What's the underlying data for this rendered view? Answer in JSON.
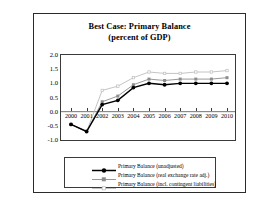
{
  "figure": {
    "title_line1": "Best Case: Primary Balance",
    "title_line2": "(percent of GDP)"
  },
  "chart_data": {
    "type": "line",
    "title": "Best Case: Primary Balance (percent of GDP)",
    "xlabel": "",
    "ylabel": "",
    "categories": [
      "2000",
      "2001",
      "2002",
      "2003",
      "2004",
      "2005",
      "2006",
      "2007",
      "2008",
      "2009",
      "2010"
    ],
    "x": [
      2000,
      2001,
      2002,
      2003,
      2004,
      2005,
      2006,
      2007,
      2008,
      2009,
      2010
    ],
    "ylim": [
      -1.0,
      2.0
    ],
    "yticks": [
      "2.0",
      "1.5",
      "1.0",
      "0.5",
      "0.0",
      "-0.5",
      "-1.0"
    ],
    "ytick_values": [
      2.0,
      1.5,
      1.0,
      0.5,
      0.0,
      -0.5,
      -1.0
    ],
    "grid": false,
    "legend_position": "below",
    "series": [
      {
        "name": "Primary Balance (unadjusted)",
        "color": "#000000",
        "marker": "diamond",
        "values": [
          -0.45,
          -0.7,
          0.25,
          0.4,
          0.85,
          1.0,
          0.95,
          1.0,
          1.0,
          1.0,
          1.0
        ]
      },
      {
        "name": "Primary Balance (real exchange rate adj.)",
        "color": "#8c8c8c",
        "marker": "square",
        "values": [
          -0.45,
          -0.7,
          0.35,
          0.55,
          0.95,
          1.15,
          1.1,
          1.15,
          1.15,
          1.15,
          1.2
        ]
      },
      {
        "name": "Primary Balance (incl. contingent liabilities)",
        "color": "#bdbdbd",
        "marker": "cross",
        "values": [
          -0.45,
          -0.7,
          0.75,
          0.9,
          1.2,
          1.4,
          1.35,
          1.35,
          1.4,
          1.4,
          1.45
        ]
      }
    ]
  },
  "legend": {
    "items": [
      {
        "label": "Primary Balance (unadjusted)"
      },
      {
        "label": "Primary Balance (real exchange rate adj.)"
      },
      {
        "label": "Primary Balance (incl. contingent liabilities)"
      }
    ]
  }
}
